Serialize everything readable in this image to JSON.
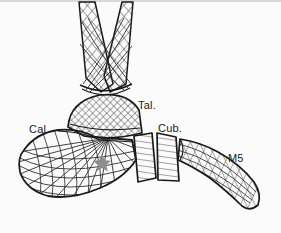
{
  "figure": {
    "background_color": "#fbfbfb",
    "line_color": "#1a1a1a",
    "hatch_color": "#3a3a3a",
    "marker_color": "#8e8e8e",
    "labels": [
      {
        "id": "cal",
        "text": "Cal.",
        "meaning": "calcaneus",
        "x": 29,
        "y": 123
      },
      {
        "id": "tal",
        "text": "Tal.",
        "meaning": "talus",
        "x": 138,
        "y": 99
      },
      {
        "id": "cub",
        "text": "Cub.",
        "meaning": "cuboid",
        "x": 158,
        "y": 122
      },
      {
        "id": "m5",
        "text": "M5",
        "meaning": "fifth metatarsal",
        "x": 228,
        "y": 152
      }
    ],
    "marker": {
      "name": "sinus-tarsi-star",
      "shape": "five-pointed-star",
      "color": "#8e8e8e",
      "x": 102,
      "y": 161,
      "size": 13
    },
    "bones": [
      {
        "id": "tibia",
        "hatch": "crosshatch-diagonal"
      },
      {
        "id": "fibula",
        "hatch": "crosshatch-diagonal"
      },
      {
        "id": "talus",
        "hatch": "crosshatch-dense"
      },
      {
        "id": "calcaneus",
        "hatch": "radiating-trabecular"
      },
      {
        "id": "navicular",
        "hatch": "horizontal"
      },
      {
        "id": "cuboid",
        "hatch": "horizontal"
      },
      {
        "id": "metatarsal5",
        "hatch": "crosshatch-longitudinal"
      }
    ]
  }
}
